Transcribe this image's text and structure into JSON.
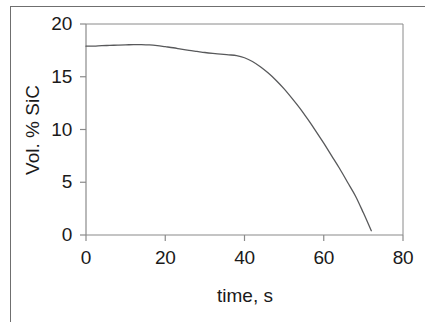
{
  "figure": {
    "background_color": "#ffffff",
    "frame_color": "#6f6f6f",
    "axis_color": "#8a8a8a",
    "curve_color": "#58595b",
    "text_color": "#1a1a1a"
  },
  "chart_data": {
    "type": "line",
    "title": "",
    "subtitle": "",
    "xlabel": "time, s",
    "ylabel": "Vol. % SiC",
    "xlim": [
      0,
      80
    ],
    "ylim": [
      0,
      20
    ],
    "xticks": [
      0,
      20,
      40,
      60,
      80
    ],
    "yticks": [
      0,
      5,
      10,
      15,
      20
    ],
    "xtick_labels": [
      "0",
      "20",
      "40",
      "60",
      "80"
    ],
    "ytick_labels": [
      "0",
      "5",
      "10",
      "15",
      "20"
    ],
    "grid": false,
    "gridlines_shown": [
      "top-border-at-y-20"
    ],
    "legend": null,
    "legend_position": "none",
    "annotations": [],
    "series": [
      {
        "name": "Vol. % SiC vs time",
        "x": [
          0,
          2,
          4,
          6,
          8,
          10,
          12,
          14,
          16,
          18,
          20,
          22,
          24,
          26,
          28,
          30,
          32,
          34,
          36,
          38,
          40,
          42,
          44,
          46,
          48,
          50,
          52,
          54,
          56,
          58,
          60,
          62,
          64,
          66,
          68,
          70,
          72
        ],
        "values": [
          17.9,
          17.9,
          17.95,
          17.97,
          18.0,
          18.02,
          18.05,
          18.05,
          18.02,
          17.95,
          17.85,
          17.75,
          17.62,
          17.5,
          17.4,
          17.3,
          17.22,
          17.15,
          17.08,
          17.0,
          16.8,
          16.45,
          15.95,
          15.35,
          14.65,
          13.85,
          12.95,
          12.0,
          10.95,
          9.85,
          8.7,
          7.5,
          6.3,
          5.0,
          3.7,
          2.1,
          0.4
        ]
      }
    ]
  },
  "axes": {
    "y_labels": [
      "20",
      "15",
      "10",
      "5",
      "0"
    ],
    "x_labels": [
      "0",
      "20",
      "40",
      "60",
      "80"
    ],
    "x_title": "time, s",
    "y_title": "Vol. % SiC"
  }
}
